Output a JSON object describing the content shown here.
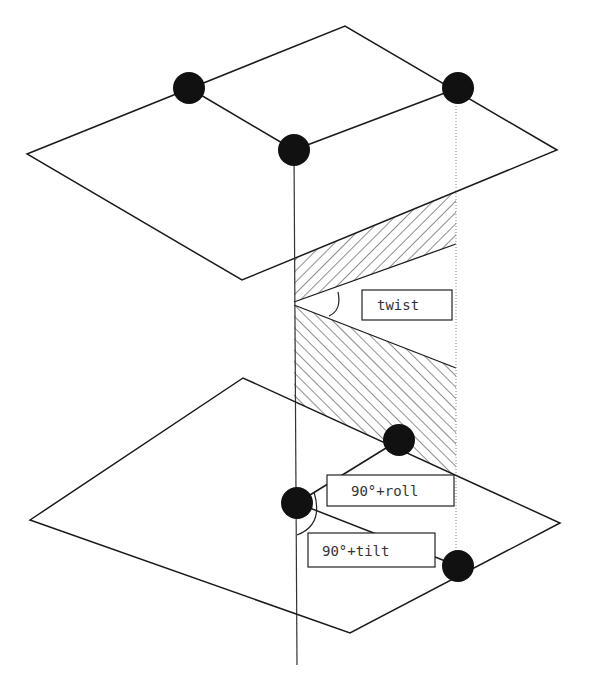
{
  "diagram": {
    "labels": {
      "twist": "twist",
      "roll": "90°+roll",
      "tilt": "90°+tilt"
    },
    "colors": {
      "line": "#1a1a1a",
      "dot": "#111111",
      "background": "#ffffff"
    },
    "upper_plane": {
      "vertices": [
        [
          27,
          154
        ],
        [
          345,
          26
        ],
        [
          557,
          150
        ],
        [
          242,
          280
        ]
      ],
      "dots": [
        [
          189,
          88
        ],
        [
          458,
          88
        ],
        [
          294,
          150
        ]
      ]
    },
    "lower_plane": {
      "vertices": [
        [
          30,
          520
        ],
        [
          243,
          378
        ],
        [
          560,
          523
        ],
        [
          350,
          633
        ]
      ],
      "dots": [
        [
          399,
          440
        ],
        [
          297,
          503
        ],
        [
          458,
          566
        ]
      ]
    }
  }
}
